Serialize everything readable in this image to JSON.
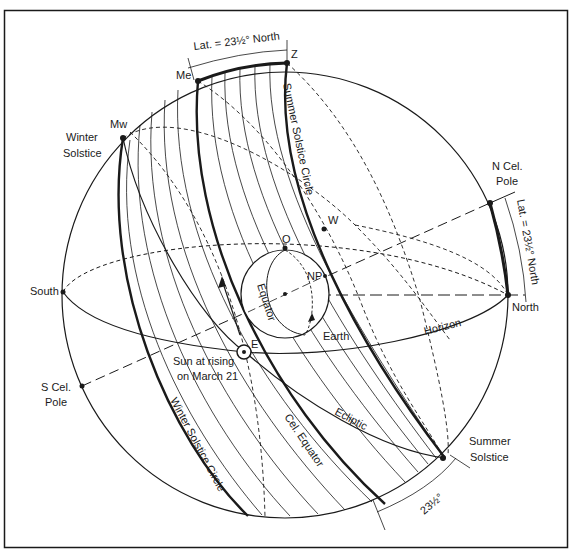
{
  "diagram": {
    "colors": {
      "ink": "#1a1a1a",
      "background": "#ffffff"
    },
    "labels": {
      "lat_top": "Lat. = 23½° North",
      "lat_right": "Lat. = 23½° North",
      "zenith": "Z",
      "me": "Me",
      "mw": "Mw",
      "winter_solstice_1": "Winter",
      "winter_solstice_2": "Solstice",
      "summer_solstice_circle": "Summer Solstice Circle",
      "n_cel_pole_1": "N Cel.",
      "n_cel_pole_2": "Pole",
      "west": "W",
      "o": "O",
      "np": "NP",
      "equator": "Equator",
      "earth": "Earth",
      "south": "South",
      "north": "North",
      "horizon": "Horizon",
      "east": "E",
      "sun_rising_1": "Sun at rising",
      "sun_rising_2": "on March 21",
      "s_cel_pole_1": "S Cel.",
      "s_cel_pole_2": "Pole",
      "winter_solstice_circle": "Winter Solstice Circle",
      "cel_equator": "Cel. Equator",
      "ecliptic": "Ecliptic",
      "summer_solstice_1": "Summer",
      "summer_solstice_2": "Solstice",
      "angle_bottom": "23½°"
    }
  }
}
